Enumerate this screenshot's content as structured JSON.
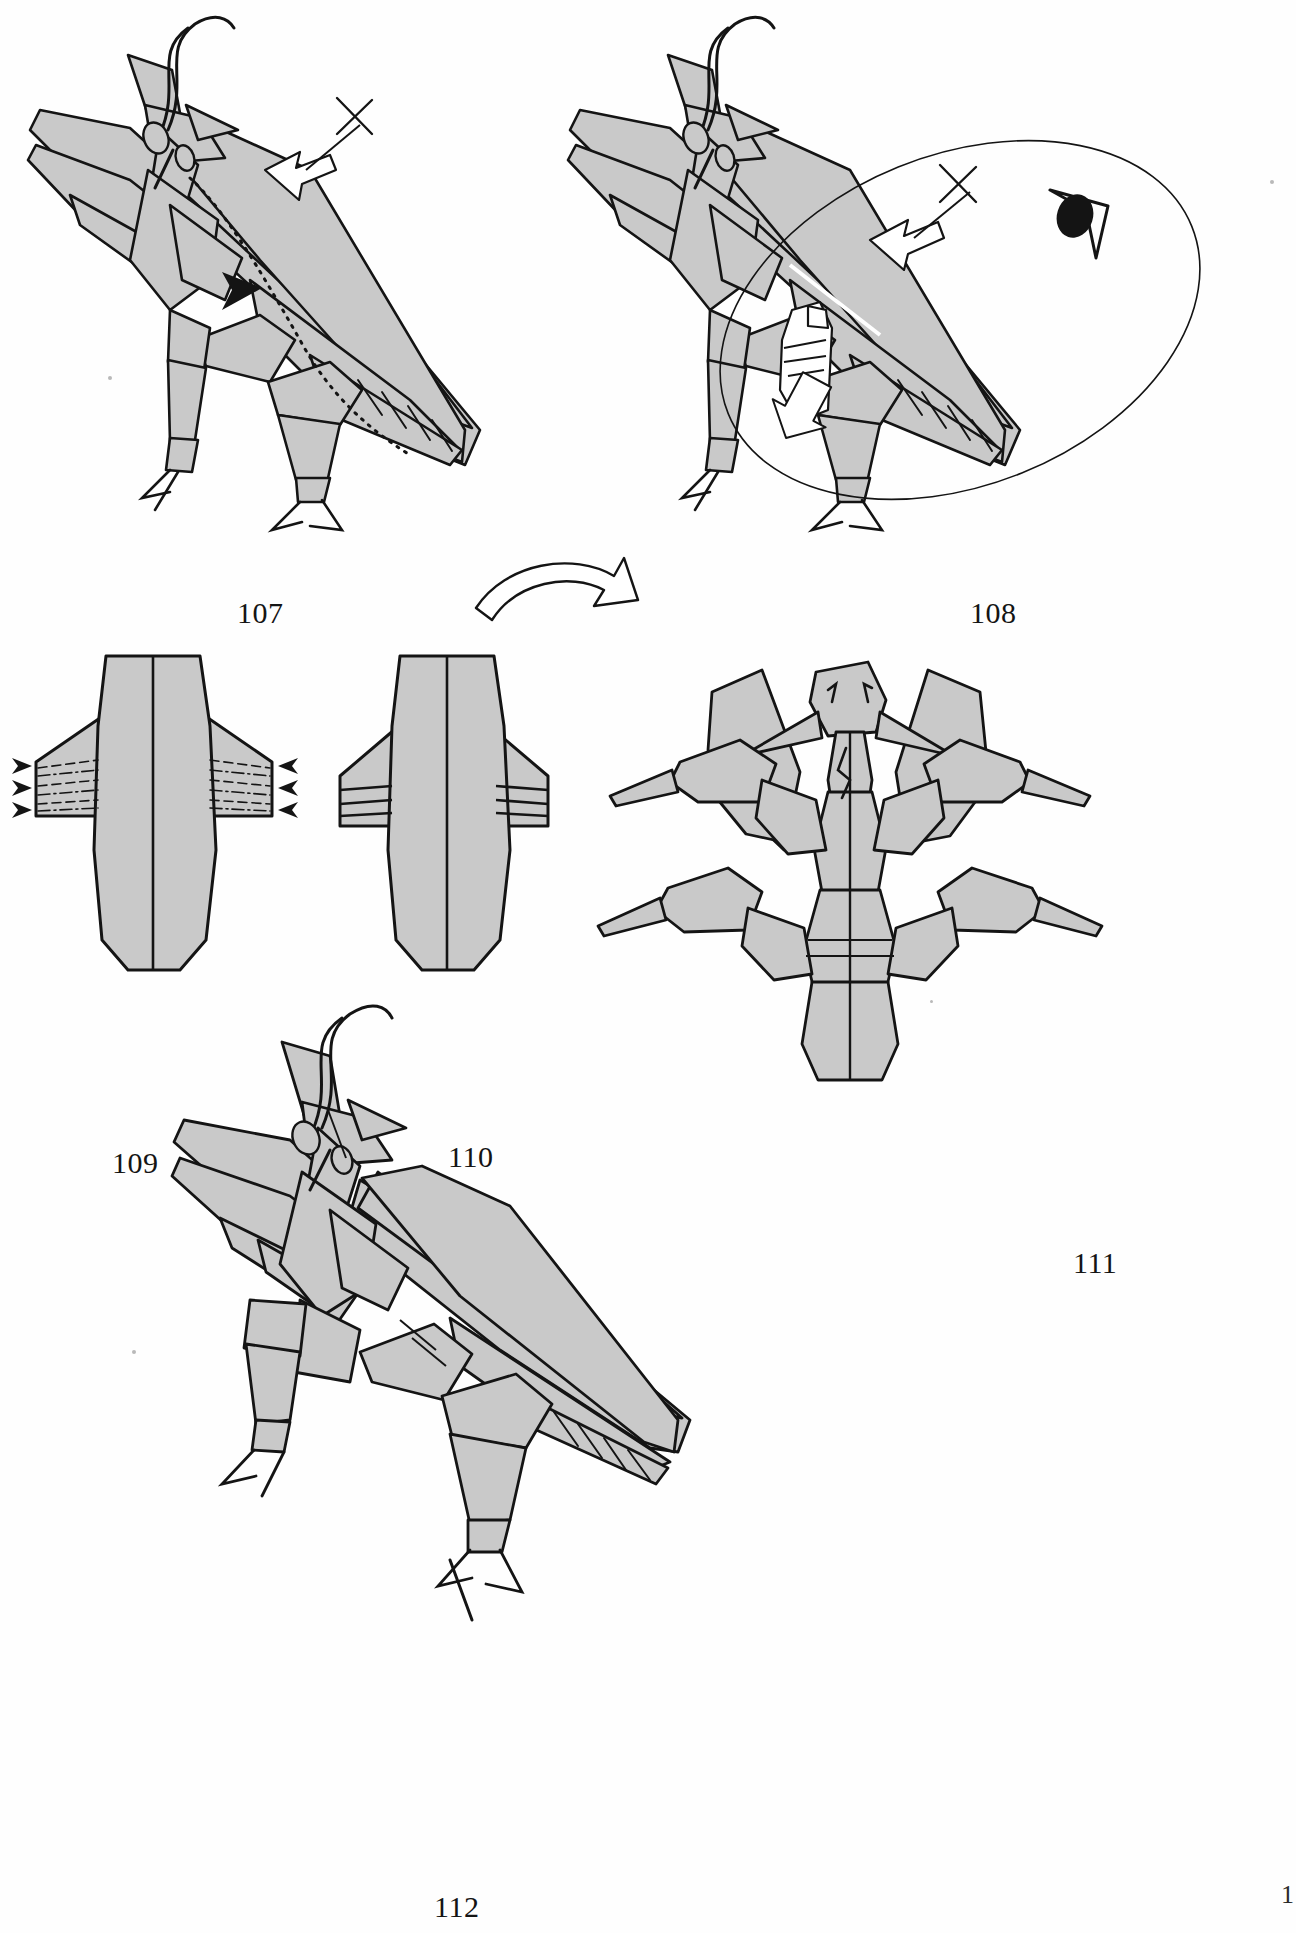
{
  "document": {
    "type": "origami-instruction-page",
    "subject": "Praying Mantis",
    "page_number": "1",
    "background_color": "#ffffff",
    "paper_fill": "#c9c9c9",
    "line_color": "#141414"
  },
  "figures": [
    {
      "id": "fig-107",
      "caption": "107",
      "view": "side view of folded praying mantis, head upper-left, abdomen lower-right",
      "symbols": [
        {
          "name": "hollow-arrow",
          "meaning": "valley fold / fold in direction of arrow"
        },
        {
          "name": "x-mark",
          "meaning": "repeat-equal cross mark"
        },
        {
          "name": "solid-black-arrowhead",
          "meaning": "push / sink here"
        },
        {
          "name": "dash-dot-line",
          "meaning": "hidden crease along abdomen"
        }
      ]
    },
    {
      "id": "fig-108",
      "caption": "108",
      "view": "side view with magnifier ellipse over abdomen and fingers shown pulling paper",
      "symbols": [
        {
          "name": "hollow-arrow",
          "meaning": "fold in direction of arrow"
        },
        {
          "name": "x-mark",
          "meaning": "repeat-equal cross mark"
        },
        {
          "name": "eye-icon",
          "meaning": "view from this direction"
        },
        {
          "name": "ellipse-outline",
          "meaning": "area of detail"
        },
        {
          "name": "hand-finger",
          "meaning": "pull gently"
        }
      ]
    },
    {
      "id": "fig-109",
      "caption": "109",
      "view": "flat symmetric abdomen with two side flaps, pleat creases marked",
      "symbols": [
        {
          "name": "black-arrowhead-left",
          "meaning": "pleat inward"
        },
        {
          "name": "black-arrowhead-right",
          "meaning": "pleat inward"
        },
        {
          "name": "dashed-line",
          "meaning": "valley fold"
        },
        {
          "name": "dash-dot-line",
          "meaning": "mountain fold"
        }
      ],
      "arrow_counts": {
        "left": 3,
        "right": 3
      }
    },
    {
      "id": "fig-110",
      "caption": "110",
      "view": "same abdomen after pleating, accordion edges on both sides",
      "symbols": [
        {
          "name": "rotate-arrow",
          "meaning": "turn model over / rotate"
        },
        {
          "name": "black-arrowhead-right",
          "meaning": "pleat inward"
        }
      ]
    },
    {
      "id": "fig-111",
      "caption": "111",
      "view": "front view of completed mantis, forelegs raised, four walking legs spread"
    },
    {
      "id": "fig-112",
      "caption": "112",
      "view": "finished praying mantis, three-quarter side view"
    }
  ]
}
